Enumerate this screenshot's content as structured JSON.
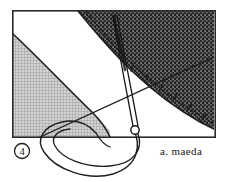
{
  "figure": {
    "kind": "hand-drawn-technical-sketch",
    "panel_number": "4",
    "signature": "a. maeda",
    "background_color": "#ffffff",
    "ink_color": "#1a1a1a",
    "frame": {
      "x": 12,
      "y": 10,
      "width": 203,
      "height": 128,
      "stroke_width": 1.6,
      "stroke_color": "#2b2b2b"
    },
    "regions": [
      {
        "name": "dark-stippled-region",
        "position": "upper-right",
        "fill_color": "#4a4a4a",
        "texture": "dense-stipple",
        "description": "Large dark speckled area occupying the upper right, bounded below-left by a smooth concave curve"
      },
      {
        "name": "grid-hatched-region",
        "position": "lower-left",
        "fill_color": "#b4b4b4",
        "texture": "fine-cross-hatch-grid",
        "description": "Light gray grid-textured triangular region in the lower left bounded above-right by a convex curve"
      },
      {
        "name": "white-band-region",
        "position": "center-diagonal",
        "fill_color": "#ffffff",
        "texture": "none",
        "description": "Clear white diagonal band separating the two textured regions"
      }
    ],
    "curves": [
      {
        "name": "dark-region-boundary",
        "style": "solid",
        "stroke_width": 1.5,
        "description": "Smooth concave curve forming the lower-left edge of the dark stippled region"
      },
      {
        "name": "dashed-offset-curve",
        "style": "dashed",
        "stroke_width": 1.2,
        "dash_pattern": "3 2.5",
        "description": "Dashed curve running parallel just inside the dark stippled region boundary"
      },
      {
        "name": "grid-region-boundary",
        "style": "solid",
        "stroke_width": 1.5,
        "description": "Convex curve forming the upper-right edge of the grid hatched region"
      },
      {
        "name": "lower-loop-curve",
        "style": "solid",
        "stroke_width": 1.4,
        "description": "Large open loop extending below the frame baseline and returning to the pivot node"
      },
      {
        "name": "secondary-loop-curve",
        "style": "solid",
        "stroke_width": 1.3,
        "description": "Inner companion loop nested within the lower loop"
      },
      {
        "name": "long-diagonal-chord",
        "style": "solid",
        "stroke_width": 1.3,
        "description": "Straight diagonal chord crossing from the lower left through the central band"
      }
    ],
    "hatch_ticks": {
      "name": "boundary-hatch-ticks",
      "count": 6,
      "description": "Short tick marks along the dark region boundary pointing into the shaded side"
    },
    "rod": {
      "name": "slender-rod",
      "description": "Long narrow two-edged rod running from the upper stippled area down to a small circular pivot node near the baseline",
      "stroke_width": 1.2
    },
    "pivot_node": {
      "name": "pivot-circle",
      "cx": 135,
      "cy": 130,
      "r": 4.2,
      "description": "Small open circle where the rod meets the loops at the baseline"
    },
    "panel_badge": {
      "name": "circled-panel-number",
      "cx": 22,
      "cy": 151,
      "r": 7.5
    }
  }
}
